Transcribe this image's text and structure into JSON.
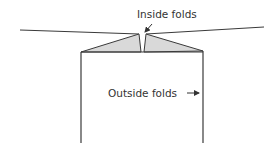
{
  "diagram": {
    "labels": {
      "inside_folds": "Inside folds",
      "outside_folds": "Outside folds"
    },
    "colors": {
      "stroke": "#3a3a3a",
      "flap_fill": "#d9d9d9",
      "text": "#333333",
      "background": "#ffffff"
    }
  }
}
